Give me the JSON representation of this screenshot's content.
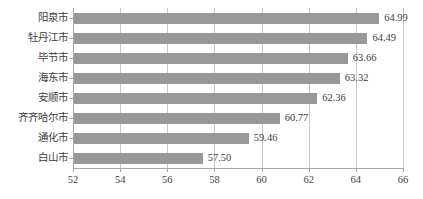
{
  "chart_data": {
    "type": "bar",
    "orientation": "horizontal",
    "title": "",
    "subtitle": "",
    "xlabel": "",
    "ylabel": "",
    "categories": [
      "阳泉市",
      "牡丹江市",
      "毕节市",
      "海东市",
      "安顺市",
      "齐齐哈尔市",
      "通化市",
      "白山市"
    ],
    "values": [
      64.99,
      64.49,
      63.66,
      63.32,
      62.36,
      60.77,
      59.46,
      57.5
    ],
    "value_labels": [
      "64.99",
      "64.49",
      "63.66",
      "63.32",
      "62.36",
      "60.77",
      "59.46",
      "57.50"
    ],
    "xlim": [
      52,
      66
    ],
    "xticks": [
      52,
      54,
      56,
      58,
      60,
      62,
      64,
      66
    ],
    "xtick_labels": [
      "52",
      "54",
      "56",
      "58",
      "60",
      "62",
      "64",
      "66"
    ],
    "grid": "vertical",
    "legend": "none",
    "bar_color": "#989898",
    "axis_color": "#a6a6a6",
    "gridline_color": "#c9c9c9",
    "text_color": "#3d3d3d",
    "background_color": "#ffffff"
  }
}
